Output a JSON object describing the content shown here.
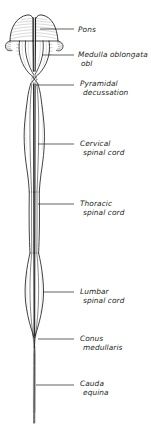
{
  "figure": {
    "kind": "anatomical-line-drawing",
    "view": "ventral",
    "background_color": "#ffffff",
    "ink_color": "#231f20",
    "leader_line_color": "#231f20"
  },
  "labels": [
    {
      "id": "pons",
      "line1": "Pons",
      "line2": "",
      "text_x": 78,
      "text_y": 25,
      "leader_x1": 40,
      "leader_x2": 74,
      "leader_y": 29
    },
    {
      "id": "medulla-oblongata",
      "line1": "Medulla oblongata",
      "line2": "obl",
      "text_x": 78,
      "text_y": 50,
      "leader_x1": 42,
      "leader_x2": 74,
      "leader_y": 55
    },
    {
      "id": "pyramidal-decussation",
      "line1": "Pyramidal",
      "line2": "decussation",
      "text_x": 80,
      "text_y": 79,
      "leader_x1": 36,
      "leader_x2": 74,
      "leader_y": 85
    },
    {
      "id": "cervical-spinal-cord",
      "line1": "Cervical",
      "line2": "spinal cord",
      "text_x": 80,
      "text_y": 139,
      "leader_x1": 38,
      "leader_x2": 74,
      "leader_y": 144
    },
    {
      "id": "thoracic-spinal-cord",
      "line1": "Thoracic",
      "line2": "spinal cord",
      "text_x": 80,
      "text_y": 199,
      "leader_x1": 38,
      "leader_x2": 74,
      "leader_y": 204
    },
    {
      "id": "lumbar-spinal-cord",
      "line1": "Lumbar",
      "line2": "spinal cord",
      "text_x": 80,
      "text_y": 287,
      "leader_x1": 43,
      "leader_x2": 74,
      "leader_y": 292
    },
    {
      "id": "conus-medullaris",
      "line1": "Conus",
      "line2": "medullaris",
      "text_x": 80,
      "text_y": 334,
      "leader_x1": 38,
      "leader_x2": 74,
      "leader_y": 339
    },
    {
      "id": "cauda-equina",
      "line1": "Cauda",
      "line2": "equina",
      "text_x": 80,
      "text_y": 379,
      "leader_x1": 36,
      "leader_x2": 74,
      "leader_y": 385
    }
  ]
}
